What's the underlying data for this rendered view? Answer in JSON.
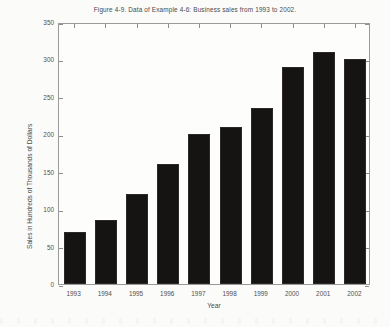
{
  "figure": {
    "title": "Figure 4-9. Data of Example 4-6: Business sales from 1993 to 2002.",
    "background_color": "#fbfbfa",
    "frame_color": "#9a9a9a",
    "bar_color": "#161412"
  },
  "chart_data": {
    "type": "bar",
    "title": "Figure 4-9. Data of Example 4-6: Business sales from 1993 to 2002.",
    "xlabel": "Year",
    "ylabel": "Sales in Hundreds of Thousands of Dollars",
    "categories": [
      "1993",
      "1994",
      "1995",
      "1996",
      "1997",
      "1998",
      "1999",
      "2000",
      "2001",
      "2002"
    ],
    "values": [
      70,
      85,
      120,
      160,
      200,
      210,
      235,
      290,
      310,
      300
    ],
    "ylim": [
      0,
      350
    ],
    "ytick_values": [
      0,
      50,
      100,
      150,
      200,
      250,
      300,
      350
    ],
    "ytick_labels": [
      "0",
      "50",
      "100",
      "150",
      "200",
      "250",
      "300",
      "350"
    ],
    "grid": false,
    "legend": false,
    "legend_position": "none",
    "bar_color": "#161412",
    "series": [
      {
        "name": "Business sales",
        "values": [
          70,
          85,
          120,
          160,
          200,
          210,
          235,
          290,
          310,
          300
        ]
      }
    ]
  }
}
